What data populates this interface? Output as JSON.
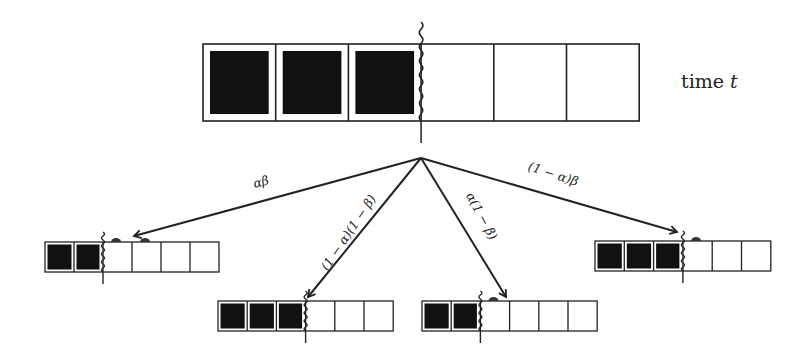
{
  "time_label": {
    "text": "time",
    "var": "t"
  },
  "colors": {
    "stroke": "#222222",
    "fill": "#111111",
    "background": "#ffffff",
    "bump": "#333333"
  },
  "root_queue": {
    "x": 203,
    "y": 44,
    "cell_w": 72.7,
    "cell_h": 77,
    "cells": 6,
    "filled": 3,
    "server_x": 421,
    "wave_top": 22,
    "wave_bottom": 143
  },
  "apex": {
    "x": 421,
    "y": 158
  },
  "branches": [
    {
      "id": "ab",
      "label": "αβ",
      "label_pos": {
        "x": 262,
        "y": 186,
        "rot": -14
      },
      "arrow_to": {
        "x": 134,
        "y": 236
      },
      "queue": {
        "x": 45,
        "y": 242,
        "cell_w": 29,
        "cell_h": 30,
        "cells": 6,
        "filled": 2,
        "bumps": [
          2,
          3
        ]
      }
    },
    {
      "id": "1ma1mb",
      "label": "(1 − α)(1 − β)",
      "label_pos": {
        "x": 352,
        "y": 235,
        "rot": -56
      },
      "arrow_to": {
        "x": 308,
        "y": 297
      },
      "queue": {
        "x": 218,
        "y": 301,
        "cell_w": 29.2,
        "cell_h": 30,
        "cells": 6,
        "filled": 3,
        "bumps": []
      }
    },
    {
      "id": "a1mb",
      "label": "α(1 − β)",
      "label_pos": {
        "x": 478,
        "y": 218,
        "rot": 62
      },
      "arrow_to": {
        "x": 506,
        "y": 297
      },
      "queue": {
        "x": 422,
        "y": 301,
        "cell_w": 29.2,
        "cell_h": 30,
        "cells": 6,
        "filled": 2,
        "bumps": [
          2
        ]
      }
    },
    {
      "id": "1mab",
      "label": "(1 − α)β",
      "label_pos": {
        "x": 552,
        "y": 178,
        "rot": 18
      },
      "arrow_to": {
        "x": 677,
        "y": 232
      },
      "queue": {
        "x": 595,
        "y": 241,
        "cell_w": 29.3,
        "cell_h": 30,
        "cells": 6,
        "filled": 3,
        "bumps": [
          3
        ]
      }
    }
  ]
}
